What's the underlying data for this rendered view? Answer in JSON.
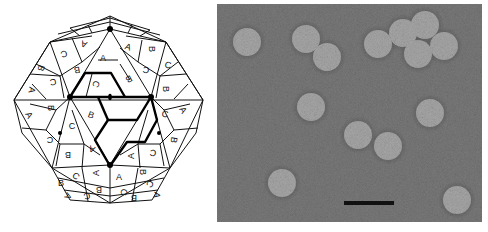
{
  "figure": {
    "left_panel": {
      "type": "icosahedral-capsid-diagram",
      "description": "T=3 icosahedral capsid surface lattice with subunits labeled A, B, C; bold outline marks one triangular face / asymmetric units; black dots mark symmetry axes",
      "subunit_labels": [
        "A",
        "B",
        "C"
      ],
      "line_color": "#111111",
      "background": "#ffffff",
      "labels": [
        {
          "t": "C",
          "x": 64,
          "y": 54,
          "r": 160
        },
        {
          "t": "A",
          "x": 84,
          "y": 44,
          "r": 200
        },
        {
          "t": "B",
          "x": 41,
          "y": 68,
          "r": 110
        },
        {
          "t": "B",
          "x": 77,
          "y": 70,
          "r": 170
        },
        {
          "t": "C",
          "x": 53,
          "y": 82,
          "r": 170
        },
        {
          "t": "A",
          "x": 32,
          "y": 90,
          "r": 100
        },
        {
          "t": "A",
          "x": 103,
          "y": 58,
          "r": 0
        },
        {
          "t": "A",
          "x": 128,
          "y": 47,
          "r": 20
        },
        {
          "t": "B",
          "x": 152,
          "y": 49,
          "r": 90
        },
        {
          "t": "B",
          "x": 129,
          "y": 79,
          "r": 150
        },
        {
          "t": "C",
          "x": 146,
          "y": 70,
          "r": 190
        },
        {
          "t": "C",
          "x": 168,
          "y": 65,
          "r": 10
        },
        {
          "t": "B",
          "x": 166,
          "y": 89,
          "r": 90
        },
        {
          "t": "C",
          "x": 96,
          "y": 84,
          "r": 110
        },
        {
          "t": "B",
          "x": 51,
          "y": 108,
          "r": 90
        },
        {
          "t": "A",
          "x": 29,
          "y": 115,
          "r": 60
        },
        {
          "t": "B",
          "x": 91,
          "y": 115,
          "r": 20
        },
        {
          "t": "C",
          "x": 72,
          "y": 126,
          "r": 0
        },
        {
          "t": "C",
          "x": 50,
          "y": 140,
          "r": 180
        },
        {
          "t": "B",
          "x": 68,
          "y": 155,
          "r": 180
        },
        {
          "t": "A",
          "x": 92,
          "y": 149,
          "r": 200
        },
        {
          "t": "C",
          "x": 165,
          "y": 114,
          "r": 10
        },
        {
          "t": "A",
          "x": 183,
          "y": 110,
          "r": 60
        },
        {
          "t": "B",
          "x": 174,
          "y": 140,
          "r": 100
        },
        {
          "t": "A",
          "x": 131,
          "y": 156,
          "r": 270
        },
        {
          "t": "C",
          "x": 153,
          "y": 153,
          "r": 190
        },
        {
          "t": "B",
          "x": 61,
          "y": 183,
          "r": 0
        },
        {
          "t": "C",
          "x": 76,
          "y": 176,
          "r": 40
        },
        {
          "t": "A",
          "x": 96,
          "y": 173,
          "r": 270
        },
        {
          "t": "B",
          "x": 99,
          "y": 190,
          "r": 180
        },
        {
          "t": "A",
          "x": 68,
          "y": 196,
          "r": 120
        },
        {
          "t": "C",
          "x": 87,
          "y": 196,
          "r": 160
        },
        {
          "t": "A",
          "x": 119,
          "y": 177,
          "r": 0
        },
        {
          "t": "B",
          "x": 143,
          "y": 172,
          "r": 90
        },
        {
          "t": "C",
          "x": 124,
          "y": 192,
          "r": 110
        },
        {
          "t": "C",
          "x": 150,
          "y": 184,
          "r": 130
        },
        {
          "t": "B",
          "x": 134,
          "y": 198,
          "r": 180
        },
        {
          "t": "A",
          "x": 157,
          "y": 195,
          "r": 100
        }
      ]
    },
    "right_panel": {
      "type": "electron-micrograph",
      "description": "Negatively stained spherical virus particles",
      "background_color": "#7a7a7a",
      "particle_color": "#a8a8a8",
      "particle_radius": 14,
      "particle_count": 14,
      "particles": [
        {
          "x": 30,
          "y": 38
        },
        {
          "x": 89,
          "y": 35
        },
        {
          "x": 110,
          "y": 53
        },
        {
          "x": 161,
          "y": 40
        },
        {
          "x": 186,
          "y": 29
        },
        {
          "x": 208,
          "y": 21
        },
        {
          "x": 201,
          "y": 50
        },
        {
          "x": 227,
          "y": 42
        },
        {
          "x": 94,
          "y": 103
        },
        {
          "x": 213,
          "y": 109
        },
        {
          "x": 141,
          "y": 131
        },
        {
          "x": 171,
          "y": 142
        },
        {
          "x": 65,
          "y": 179
        },
        {
          "x": 240,
          "y": 196
        }
      ],
      "scale_bar": {
        "x": 127,
        "y": 197,
        "width": 50,
        "height": 4,
        "color": "#111111",
        "label": ""
      }
    }
  }
}
